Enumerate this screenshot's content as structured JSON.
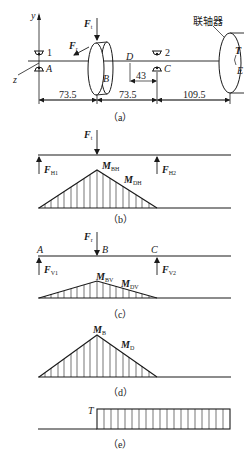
{
  "figure": {
    "a": {
      "caption": "（a）",
      "axis_y": "y",
      "axis_z": "z",
      "bearing1_label": "1",
      "bearing2_label": "2",
      "point_A": "A",
      "point_B": "B",
      "point_C": "C",
      "point_D": "D",
      "point_E": "E",
      "force_Ft": {
        "main": "F",
        "sub": "t"
      },
      "force_Fr": {
        "main": "F",
        "sub": "r"
      },
      "torque": "T",
      "coupling_label": "联轴器",
      "dim_AB": "73.5",
      "dim_BC": "73.5",
      "dim_CE": "109.5",
      "dim_DC": "43"
    },
    "b": {
      "caption": "（b）",
      "force_Ft": {
        "main": "F",
        "sub": "t"
      },
      "reaction1": {
        "main": "F",
        "sub": "H1"
      },
      "reaction2": {
        "main": "F",
        "sub": "H2"
      },
      "moment_B": {
        "main": "M",
        "sub": "BH"
      },
      "moment_D": {
        "main": "M",
        "sub": "DH"
      }
    },
    "c": {
      "caption": "（c）",
      "point_A": "A",
      "point_B": "B",
      "point_C": "C",
      "force_Fr": {
        "main": "F",
        "sub": "r"
      },
      "reaction1": {
        "main": "F",
        "sub": "V1"
      },
      "reaction2": {
        "main": "F",
        "sub": "V2"
      },
      "moment_B": {
        "main": "M",
        "sub": "BV"
      },
      "moment_D": {
        "main": "M",
        "sub": "DV"
      }
    },
    "d": {
      "caption": "（d）",
      "moment_B": {
        "main": "M",
        "sub": "B"
      },
      "moment_D": {
        "main": "M",
        "sub": "D"
      }
    },
    "e": {
      "caption": "（e）",
      "torque": "T"
    }
  }
}
